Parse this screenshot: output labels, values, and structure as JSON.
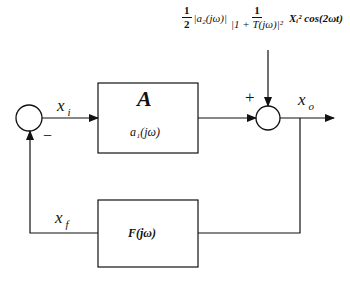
{
  "diagram": {
    "type": "feedback-block-diagram",
    "forward_block": {
      "title": "A",
      "transfer": "a₁(jω)"
    },
    "feedback_block": {
      "transfer": "F(jω)"
    },
    "signals": {
      "input_error": {
        "name": "x",
        "sub": "i"
      },
      "output": {
        "name": "x",
        "sub": "o"
      },
      "feedback": {
        "name": "x",
        "sub": "f"
      }
    },
    "summing_junctions": {
      "left": {
        "sign": "−"
      },
      "right": {
        "sign": "+"
      }
    },
    "disturbance": {
      "half_num": "1",
      "half_den": "2",
      "mag_a2": "|a₂(jω)|",
      "frac_num": "1",
      "frac_den": "|1 + T(jω)|²",
      "tail": "Xᵢ² cos(2ωt)"
    }
  }
}
